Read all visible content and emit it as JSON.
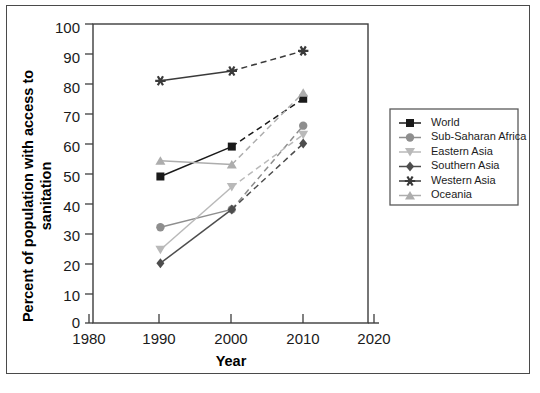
{
  "chart_data": {
    "type": "line",
    "title": "",
    "xlabel": "Year",
    "ylabel": "Percent of population with access to sanitation",
    "x": [
      1990,
      2000,
      2010
    ],
    "xlim": [
      1980,
      2020
    ],
    "ylim": [
      0,
      100
    ],
    "xticks": [
      1980,
      1990,
      2000,
      2010,
      2020
    ],
    "yticks": [
      0,
      10,
      20,
      30,
      40,
      50,
      60,
      70,
      80,
      90,
      100
    ],
    "grid": false,
    "legend_position": "right",
    "series": [
      {
        "name": "World",
        "values": [
          49,
          59,
          75
        ],
        "color": "#1a1a1a",
        "marker": "square",
        "dash_last_segment": true
      },
      {
        "name": "Sub-Saharan Africa",
        "values": [
          32,
          38,
          66
        ],
        "color": "#8e8e8e",
        "marker": "circle",
        "dash_last_segment": true
      },
      {
        "name": "Eastern Asia",
        "values": [
          24.5,
          45.5,
          63
        ],
        "color": "#b9b9b9",
        "marker": "triangle-down",
        "dash_last_segment": true
      },
      {
        "name": "Southern Asia",
        "values": [
          20,
          38,
          60
        ],
        "color": "#4d4d4d",
        "marker": "diamond",
        "dash_last_segment": true
      },
      {
        "name": "Western Asia",
        "values": [
          81,
          84.3,
          91
        ],
        "color": "#3a3a3a",
        "marker": "star",
        "dash_last_segment": true
      },
      {
        "name": "Oceania",
        "values": [
          54.3,
          53,
          77
        ],
        "color": "#adadad",
        "marker": "triangle-up",
        "dash_last_segment": true
      }
    ]
  },
  "axes": {
    "ylabel_line1": "Percent of population with access to",
    "ylabel_line2": "sanitation",
    "xlabel": "Year"
  },
  "legend": {
    "items": [
      {
        "label": "World"
      },
      {
        "label": "Sub-Saharan Africa"
      },
      {
        "label": "Eastern Asia"
      },
      {
        "label": "Southern Asia"
      },
      {
        "label": "Western Asia"
      },
      {
        "label": "Oceania"
      }
    ]
  }
}
